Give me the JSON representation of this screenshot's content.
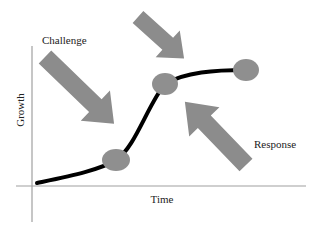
{
  "diagram": {
    "type": "growth-curve",
    "labels": {
      "challenge": "Challenge",
      "response": "Response",
      "y_axis": "Growth",
      "x_axis": "Time"
    },
    "nodes": [
      {
        "id": "node-low",
        "cx": 116,
        "cy": 160
      },
      {
        "id": "node-mid",
        "cx": 165,
        "cy": 84
      },
      {
        "id": "node-high",
        "cx": 246,
        "cy": 70
      }
    ],
    "arrows": [
      {
        "id": "challenge-arrow",
        "direction": "down-right"
      },
      {
        "id": "top-arrow",
        "direction": "down-right"
      },
      {
        "id": "response-arrow",
        "direction": "up-left"
      }
    ],
    "colors": {
      "arrow_fill": "#8c8c8c",
      "node_fill": "#8f8f8f",
      "curve": "#000000",
      "axis": "#a0a0a0",
      "text": "#222222"
    }
  }
}
